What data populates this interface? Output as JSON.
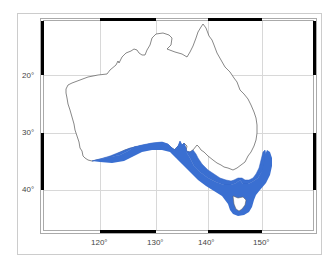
{
  "map": {
    "region": "Australia",
    "projection_extent": {
      "lon_min": 111,
      "lon_max": 155,
      "lat_min": 10,
      "lat_max": 47
    },
    "lon_ticks": [
      {
        "value": 120,
        "label": "120°"
      },
      {
        "value": 130,
        "label": "130°"
      },
      {
        "value": 140,
        "label": "140°"
      },
      {
        "value": 150,
        "label": "150°"
      }
    ],
    "lat_ticks": [
      {
        "value": 20,
        "label": "20°"
      },
      {
        "value": 30,
        "label": "30°"
      },
      {
        "value": 40,
        "label": "40°"
      }
    ],
    "colors": {
      "land": "#ffffff",
      "coastline": "#555555",
      "shaded_range": "#3a6fd1",
      "grid": "#d8d8d8",
      "frame": "#000000",
      "panel_border": "#cccccc"
    },
    "shaded_region": "Southern Australian coastal waters (range band from SW Western Australia to NSW south coast, around Tasmania)"
  }
}
